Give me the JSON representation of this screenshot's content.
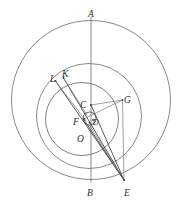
{
  "figure": {
    "type": "geometry-diagram",
    "canvas": {
      "width": 181,
      "height": 203
    },
    "stroke_color": "#6b6b6b",
    "label_color": "#2e2e2e",
    "background": "#ffffff"
  },
  "circles": [
    {
      "name": "outer-circle",
      "cx": 91,
      "cy": 100,
      "r": 79.5
    },
    {
      "name": "middle-circle",
      "cx": 89,
      "cy": 116,
      "r": 52.5
    },
    {
      "name": "inner-circle",
      "cx": 82,
      "cy": 119,
      "r": 36.5
    },
    {
      "name": "tiny-circle",
      "cx": 89.5,
      "cy": 118.5,
      "r": 6.5
    }
  ],
  "points": [
    {
      "name": "point-a",
      "label": "A",
      "x": 91,
      "y": 20.5,
      "lx": 90,
      "ly": 14.5
    },
    {
      "name": "point-b",
      "label": "B",
      "x": 91,
      "y": 179.5,
      "lx": 87,
      "ly": 193
    },
    {
      "name": "point-c",
      "label": "C",
      "x": 91,
      "y": 105,
      "lx": 84.5,
      "ly": 106
    },
    {
      "name": "point-d",
      "label": "D",
      "x": 93.5,
      "y": 121,
      "lx": 93.5,
      "ly": 124
    },
    {
      "name": "point-e",
      "label": "E",
      "x": 124,
      "y": 180,
      "lx": 125.5,
      "ly": 193
    },
    {
      "name": "point-f",
      "label": "F",
      "x": 83.5,
      "y": 119,
      "lx": 76,
      "ly": 126
    },
    {
      "name": "point-g",
      "label": "G",
      "x": 122.5,
      "y": 100,
      "lx": 124,
      "ly": 101
    },
    {
      "name": "point-k",
      "label": "K",
      "x": 63.5,
      "y": 78,
      "lx": 63.5,
      "ly": 76.5
    },
    {
      "name": "point-l",
      "label": "L",
      "x": 55.5,
      "y": 81,
      "lx": 52.5,
      "ly": 82.5
    },
    {
      "name": "point-o",
      "label": "O",
      "x": 89.5,
      "y": 125,
      "lx": 79.5,
      "ly": 141
    }
  ],
  "segments": [
    {
      "name": "segment-ab-diameter",
      "from": "A",
      "to": "B",
      "x1": 91,
      "y1": 17,
      "x2": 91,
      "y2": 182,
      "style": "seg"
    },
    {
      "name": "segment-le",
      "from": "L",
      "to": "E",
      "x1": 55.5,
      "y1": 81,
      "x2": 124,
      "y2": 180,
      "style": "seg-dark"
    },
    {
      "name": "segment-ke",
      "from": "K",
      "to": "E",
      "x1": 63.5,
      "y1": 78,
      "x2": 124,
      "y2": 180,
      "style": "seg-dark"
    },
    {
      "name": "segment-lf",
      "from": "L",
      "to": "F",
      "x1": 55.5,
      "y1": 81,
      "x2": 83.5,
      "y2": 119,
      "style": "seg-thin"
    },
    {
      "name": "segment-ce",
      "from": "C",
      "to": "E",
      "x1": 91,
      "y1": 105,
      "x2": 124,
      "y2": 180,
      "style": "seg-dark"
    },
    {
      "name": "segment-cg",
      "from": "C",
      "to": "G",
      "x1": 91,
      "y1": 105,
      "x2": 122.5,
      "y2": 100,
      "style": "seg-thin"
    },
    {
      "name": "segment-fg",
      "from": "F",
      "to": "G",
      "x1": 83.5,
      "y1": 119,
      "x2": 122.5,
      "y2": 100,
      "style": "seg-thin"
    },
    {
      "name": "segment-ge",
      "from": "G",
      "to": "E",
      "x1": 122.5,
      "y1": 100,
      "x2": 124,
      "y2": 180,
      "style": "seg-thin"
    },
    {
      "name": "segment-fe",
      "from": "F",
      "to": "E",
      "x1": 83.5,
      "y1": 119,
      "x2": 124,
      "y2": 180,
      "style": "seg-dark"
    },
    {
      "name": "segment-oe",
      "from": "O",
      "to": "E",
      "x1": 89.5,
      "y1": 125,
      "x2": 124,
      "y2": 180,
      "style": "seg-thin"
    },
    {
      "name": "segment-kf",
      "from": "K",
      "to": "F",
      "x1": 63.5,
      "y1": 78,
      "x2": 85,
      "y2": 115,
      "style": "seg-thin"
    }
  ],
  "labels": {
    "A": "A",
    "B": "B",
    "C": "C",
    "D": "D",
    "E": "E",
    "F": "F",
    "G": "G",
    "K": "K",
    "L": "L",
    "O": "O"
  }
}
